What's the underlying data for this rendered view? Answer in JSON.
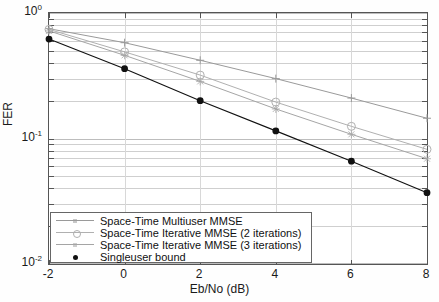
{
  "chart_data": {
    "type": "line",
    "title": "",
    "xlabel": "Eb/No (dB)",
    "ylabel": "FER",
    "xlim": [
      -2,
      8
    ],
    "ylim": [
      0.01,
      1
    ],
    "yscale": "log",
    "grid": true,
    "xticks": [
      -2,
      0,
      2,
      4,
      6,
      8
    ],
    "xticklabels": [
      "-2",
      "0",
      "2",
      "4",
      "6",
      "8"
    ],
    "yticks": [
      1,
      0.1,
      0.01
    ],
    "yticklabels": [
      "10",
      "10",
      "10"
    ],
    "yticklabel_exponents": [
      "0",
      "-1",
      "-2"
    ],
    "legend_position": "lower left",
    "x": [
      -2,
      0,
      2,
      4,
      6,
      8
    ],
    "series": [
      {
        "name": "Space-Time Multiuser MMSE",
        "marker": "plus",
        "color": "#9a9a9a",
        "values": [
          0.75,
          0.58,
          0.42,
          0.3,
          0.21,
          0.145
        ]
      },
      {
        "name": "Space-Time Iterative MMSE (2 iterations)",
        "marker": "circle",
        "color": "#b0b0b0",
        "values": [
          0.74,
          0.49,
          0.32,
          0.195,
          0.125,
          0.082
        ]
      },
      {
        "name": "Space-Time Iterative MMSE (3 iterations)",
        "marker": "star",
        "color": "#a5a5a5",
        "values": [
          0.72,
          0.46,
          0.285,
          0.172,
          0.108,
          0.069
        ]
      },
      {
        "name": "Singleuser bound",
        "marker": "filled-circle",
        "color": "#111111",
        "values": [
          0.62,
          0.36,
          0.2,
          0.115,
          0.066,
          0.037
        ]
      }
    ]
  },
  "legend": {
    "items": [
      {
        "label": "Space-Time Multiuser MMSE"
      },
      {
        "label": "Space-Time Iterative MMSE (2 iterations)"
      },
      {
        "label": "Space-Time Iterative MMSE (3 iterations)"
      },
      {
        "label": "Singleuser bound"
      }
    ]
  },
  "axes": {
    "x_title": "Eb/No (dB)",
    "y_title": "FER"
  }
}
